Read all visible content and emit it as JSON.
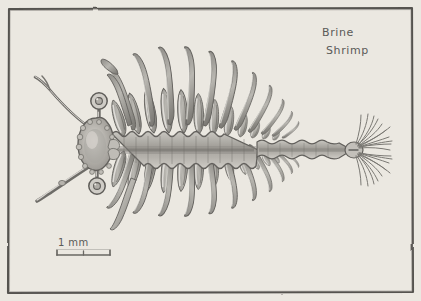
{
  "figure": {
    "kind": "hand-drawn pencil scientific illustration",
    "subject": "Brine Shrimp",
    "medium": "graphite pencil on cream paper",
    "background_color": "#f2efe9",
    "ink_color": "#6e6c68",
    "border": {
      "style": "hand-drawn rectangle",
      "color": "#55534f",
      "inset_px": 8
    }
  },
  "annotations": {
    "title_line1": "Brine",
    "title_line2": "Shrimp",
    "scale_label": "1 mm"
  },
  "scale_bar": {
    "label": "1 mm",
    "x_start": 57,
    "x_end": 110,
    "y": 255,
    "has_end_ticks": true,
    "has_center_tick": true
  },
  "anatomy": {
    "orientation": "head at left, tail at right, dorsal up",
    "head": {
      "description": "lumpy bumpy head capsule",
      "center_x": 100,
      "center_y": 145
    },
    "eyes": [
      {
        "name": "dorsal stalked eye",
        "cx": 99,
        "cy": 101,
        "r": 8
      },
      {
        "name": "ventral stalked eye",
        "cx": 97,
        "cy": 186,
        "r": 8
      }
    ],
    "antennae": [
      {
        "name": "upper antenna",
        "from_x": 90,
        "from_y": 128,
        "to_x": 36,
        "to_y": 78
      },
      {
        "name": "lower antenna",
        "from_x": 88,
        "from_y": 165,
        "to_x": 38,
        "to_y": 200
      }
    ],
    "trunk": {
      "description": "segmented thorax with wavy scalloped margins",
      "x_start": 112,
      "x_end": 258,
      "center_y": 150,
      "segments": 11
    },
    "abdomen": {
      "description": "narrow beaded segmented tail",
      "x_start": 258,
      "x_end": 352,
      "center_y": 150
    },
    "limbs": {
      "dorsal_inner_count": 11,
      "dorsal_outer_count": 11,
      "ventral_inner_count": 11,
      "ventral_outer_count": 11,
      "note": "paired phyllopodia, inner short rounded lobes and outer long curved setae"
    },
    "tail_fan": {
      "description": "two fan-shaped furcal lobes with radiating bristles",
      "x": 356,
      "y": 150,
      "lobes": 2,
      "bristles_per_lobe": 11
    }
  }
}
